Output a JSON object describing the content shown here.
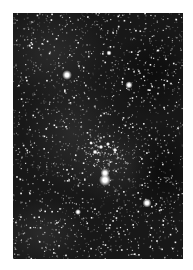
{
  "image": {
    "description": "Grayscale astronomical photograph of a dense star field",
    "frame": {
      "x": 13,
      "y": 13,
      "width": 170,
      "height": 246
    },
    "background_color": "#ffffff",
    "sky_color": "#161616",
    "nebulosity_color": "#2a2a2a"
  },
  "bright_stars": [
    {
      "x": 54,
      "y": 62,
      "r": 2.6,
      "label": "bright-star-upper-left"
    },
    {
      "x": 116,
      "y": 72,
      "r": 2.0,
      "label": "bright-star-upper-right"
    },
    {
      "x": 92,
      "y": 160,
      "r": 2.4,
      "label": "double-star-upper-component"
    },
    {
      "x": 92,
      "y": 167,
      "r": 3.2,
      "label": "double-star-lower-component"
    },
    {
      "x": 134,
      "y": 190,
      "r": 2.4,
      "label": "bright-star-lower-right"
    },
    {
      "x": 65,
      "y": 199,
      "r": 1.6,
      "label": "star-lower-left"
    },
    {
      "x": 96,
      "y": 40,
      "r": 1.4,
      "label": "star-top-center"
    },
    {
      "x": 82,
      "y": 139,
      "r": 1.3,
      "label": "cluster-star-1"
    },
    {
      "x": 88,
      "y": 134,
      "r": 1.2,
      "label": "cluster-star-2"
    },
    {
      "x": 95,
      "y": 131,
      "r": 1.1,
      "label": "cluster-star-3"
    },
    {
      "x": 102,
      "y": 137,
      "r": 1.2,
      "label": "cluster-star-4"
    },
    {
      "x": 78,
      "y": 130,
      "r": 1.0,
      "label": "cluster-star-5"
    }
  ],
  "star_field": {
    "count": 2200,
    "seed": 7,
    "cluster_center": {
      "x": 90,
      "y": 138,
      "radius": 20,
      "count": 90
    }
  }
}
